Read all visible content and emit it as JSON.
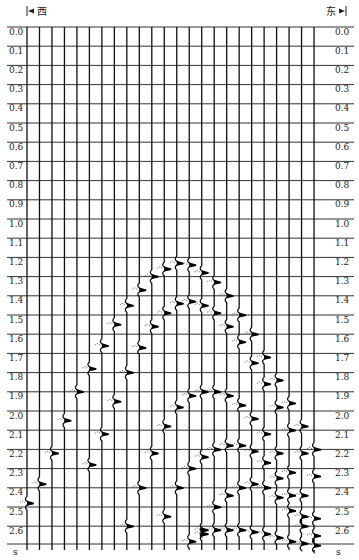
{
  "chart_data": {
    "type": "seismic_section",
    "title": "",
    "direction_left": "西",
    "direction_right": "东",
    "ylabel": "s",
    "yaxis_unit": "s",
    "y_ticks": [
      "0.0",
      "0.1",
      "0.2",
      "0.3",
      "0.4",
      "0.5",
      "0.6",
      "0.7",
      "0.8",
      "0.9",
      "1.0",
      "1.1",
      "1.2",
      "1.3",
      "1.4",
      "1.5",
      "1.6",
      "1.7",
      "1.8",
      "1.9",
      "2.0",
      "2.1",
      "2.2",
      "2.3",
      "2.4",
      "2.5",
      "2.6"
    ],
    "ylim": [
      0.0,
      2.7
    ],
    "y_inverted": true,
    "grid": true,
    "trace_count": 24,
    "events": [
      {
        "name": "diffraction-1",
        "apex_trace": 13,
        "apex_time": 1.23,
        "times": [
          2.48,
          2.38,
          2.22,
          2.05,
          1.9,
          1.78,
          1.66,
          1.55,
          1.45,
          1.37,
          1.3,
          1.26,
          1.23,
          1.24,
          1.28,
          1.33,
          1.4,
          1.5,
          1.6,
          1.72,
          1.84,
          1.96,
          2.08,
          2.2
        ]
      },
      {
        "name": "diffraction-2",
        "apex_trace": 14,
        "apex_time": 1.43,
        "times": [
          null,
          null,
          null,
          null,
          null,
          2.28,
          2.12,
          1.95,
          1.8,
          1.67,
          1.56,
          1.49,
          1.44,
          1.43,
          1.45,
          1.49,
          1.56,
          1.64,
          1.75,
          1.86,
          1.98,
          2.1,
          2.22,
          2.34
        ]
      },
      {
        "name": "diffraction-3",
        "apex_trace": 16,
        "apex_time": 1.9,
        "times": [
          null,
          null,
          null,
          null,
          null,
          null,
          null,
          null,
          2.6,
          2.4,
          2.22,
          2.08,
          1.98,
          1.92,
          1.9,
          1.9,
          1.92,
          1.97,
          2.04,
          2.12,
          2.22,
          2.32,
          2.44,
          2.56
        ]
      },
      {
        "name": "diffraction-4",
        "apex_trace": 18,
        "apex_time": 2.18,
        "times": [
          null,
          null,
          null,
          null,
          null,
          null,
          null,
          null,
          null,
          null,
          null,
          2.55,
          2.4,
          2.3,
          2.24,
          2.2,
          2.18,
          2.18,
          2.21,
          2.27,
          2.35,
          2.44,
          2.55,
          2.65
        ]
      },
      {
        "name": "diffraction-5",
        "apex_trace": 19,
        "apex_time": 2.38,
        "times": [
          null,
          null,
          null,
          null,
          null,
          null,
          null,
          null,
          null,
          null,
          null,
          null,
          null,
          null,
          2.62,
          2.5,
          2.44,
          2.4,
          2.38,
          2.4,
          2.45,
          2.52,
          2.6,
          null
        ]
      },
      {
        "name": "bottom-reflection",
        "apex_trace": 20,
        "apex_time": 2.62,
        "times": [
          null,
          null,
          null,
          null,
          null,
          null,
          null,
          null,
          null,
          null,
          null,
          null,
          null,
          2.68,
          2.64,
          2.62,
          2.62,
          2.62,
          2.63,
          2.64,
          2.66,
          2.68,
          2.69,
          2.7
        ]
      }
    ]
  },
  "labels": {
    "left_direction": "西",
    "right_direction": "东",
    "unit": "s"
  }
}
